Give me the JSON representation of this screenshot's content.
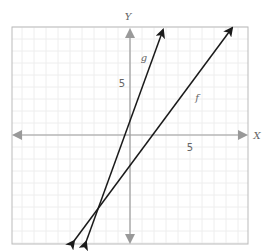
{
  "chart_data": {
    "type": "line",
    "title": "",
    "xlabel": "X",
    "ylabel": "Y",
    "xlim": [
      -10,
      10
    ],
    "ylim": [
      -9,
      9
    ],
    "grid": true,
    "grid_step": 1,
    "x_tick_labels": [
      {
        "value": 5,
        "label": "5"
      }
    ],
    "y_tick_labels": [
      {
        "value": 5,
        "label": "5"
      }
    ],
    "series": [
      {
        "name": "g",
        "label": "g",
        "slope": 3,
        "intercept": 1,
        "points": [
          [
            -3.67,
            -8.9
          ],
          [
            2.83,
            8.9
          ]
        ],
        "color": "#1a1a1a",
        "label_pos": [
          1.3,
          4.5
        ]
      },
      {
        "name": "f",
        "label": "f",
        "slope": 1.33,
        "intercept": -2.5,
        "points": [
          [
            -4.75,
            -8.9
          ],
          [
            8.58,
            9.0
          ]
        ],
        "color": "#1a1a1a",
        "label_pos": [
          5.9,
          1.9
        ]
      }
    ],
    "axis_color": "#999999",
    "grid_color": "#eeeeee",
    "frame_color": "#bbbbbb"
  },
  "labels": {
    "x_axis": "X",
    "y_axis": "Y",
    "x_tick_5": "5",
    "y_tick_5": "5",
    "line_g": "g",
    "line_f": "f"
  }
}
